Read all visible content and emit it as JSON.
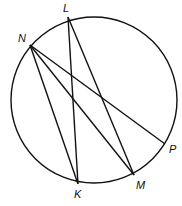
{
  "diagram": {
    "type": "circle-chords",
    "circle": {
      "cx": 94,
      "cy": 100,
      "r": 83
    },
    "points": [
      {
        "id": "L",
        "label": "L",
        "x": 68,
        "y": 17,
        "lx": 63,
        "ly": 12
      },
      {
        "id": "N",
        "label": "N",
        "x": 30,
        "y": 45,
        "lx": 18,
        "ly": 42
      },
      {
        "id": "P",
        "label": "P",
        "x": 165,
        "y": 144,
        "lx": 169,
        "ly": 153
      },
      {
        "id": "M",
        "label": "M",
        "x": 134,
        "y": 175,
        "lx": 136,
        "ly": 189
      },
      {
        "id": "K",
        "label": "K",
        "x": 78,
        "y": 184,
        "lx": 74,
        "ly": 198
      }
    ],
    "segments": [
      [
        "N",
        "P"
      ],
      [
        "N",
        "K"
      ],
      [
        "N",
        "M"
      ],
      [
        "L",
        "K"
      ],
      [
        "L",
        "M"
      ]
    ],
    "stroke_color": "#111111"
  }
}
